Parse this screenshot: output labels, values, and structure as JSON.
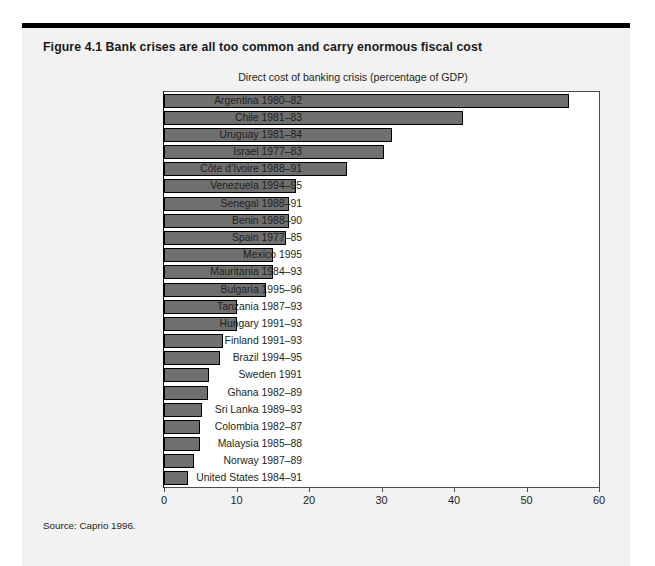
{
  "figure": {
    "title": "Figure 4.1  Bank crises are all too common and carry enormous fiscal cost",
    "source": "Source: Caprio 1996."
  },
  "chart_data": {
    "type": "bar",
    "orientation": "horizontal",
    "title": "Direct cost of banking crisis (percentage of GDP)",
    "xlabel": "",
    "ylabel": "",
    "xlim": [
      0,
      60
    ],
    "xticks": [
      0,
      10,
      20,
      30,
      40,
      50,
      60
    ],
    "xtick_labels": [
      "0",
      "10",
      "20",
      "30",
      "40",
      "50",
      "60"
    ],
    "grid": false,
    "legend": false,
    "bar_color": "#6f6f6f",
    "bar_edge_color": "#000000",
    "categories": [
      "Argentina 1980–82",
      "Chile 1981–83",
      "Uruguay 1981–84",
      "Israel 1977–83",
      "Côte d’Ivoire 1988–91",
      "Venezuela 1994–95",
      "Senegal 1988–91",
      "Benin 1988–90",
      "Spain 1977–85",
      "Mexico 1995",
      "Mauritania 1984–93",
      "Bulgaria 1995–96",
      "Tanzania 1987–93",
      "Hungary 1991–93",
      "Finland 1991–93",
      "Brazil 1994–95",
      "Sweden 1991",
      "Ghana 1982–89",
      "Sri Lanka 1989–93",
      "Colombia 1982–87",
      "Malaysia 1985–88",
      "Norway 1987–89",
      "United States 1984–91"
    ],
    "values": [
      55.8,
      41.3,
      31.4,
      30.4,
      25.2,
      18.2,
      17.2,
      17.2,
      16.8,
      15.0,
      15.0,
      14.0,
      10.1,
      10.1,
      8.1,
      7.7,
      6.2,
      6.1,
      5.2,
      5.0,
      4.9,
      4.1,
      3.3
    ]
  }
}
